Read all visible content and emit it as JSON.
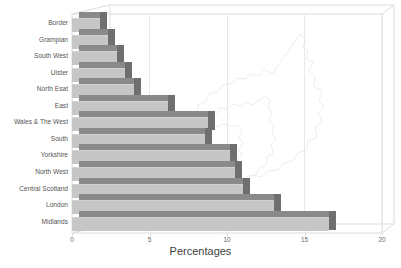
{
  "chart_data": {
    "type": "bar",
    "orientation": "horizontal",
    "title": "",
    "xlabel": "Percentages",
    "ylabel": "",
    "xlim": [
      0,
      20
    ],
    "xticks": [
      0,
      5,
      10,
      15,
      20
    ],
    "grid": true,
    "legend": false,
    "style": "3d-bar",
    "categories": [
      "Border",
      "Grampian",
      "South West",
      "Ulster",
      "North Esat",
      "East",
      "Wales & The West",
      "South",
      "Yorkshire",
      "North West",
      "Central Scotland",
      "London",
      "Midlands"
    ],
    "values": [
      1.8,
      2.3,
      2.9,
      3.4,
      4.0,
      6.2,
      8.8,
      8.6,
      10.2,
      10.5,
      11.0,
      13.0,
      16.6
    ]
  },
  "colors": {
    "bar_face": "#c6c6c6",
    "bar_top": "#8a8a8a",
    "bar_side": "#6f6f6f",
    "grid": "#e9e9e9",
    "frame": "#dcdcdc",
    "text": "#555555",
    "axis_title": "#3d3d3d",
    "map_outline": "#ededed",
    "background": "#ffffff"
  },
  "decoration": {
    "map_watermark": "british-isles-outline"
  }
}
